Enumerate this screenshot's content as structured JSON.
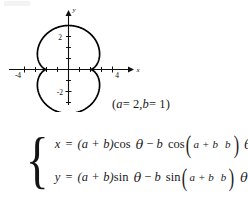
{
  "figure": {
    "caption_param": "(a = 2, b = 1)",
    "param_note": {
      "open": "(",
      "a_sym": "a",
      "a_eq": "= 2,",
      "b_sym": "b",
      "b_eq": "= 1)"
    },
    "smudge_name": "page-artifact"
  },
  "equations": {
    "brace": "{",
    "x": {
      "lhs": "x",
      "eq": "=",
      "amp": "(a + b)",
      "fn": "cos",
      "var": "θ",
      "minus": "−",
      "coef": "b",
      "fn2": "cos",
      "frac_num": "a + b",
      "frac_den": "b",
      "tail": "θ",
      "plain": "x = (a + b)cos θ − b cos((a + b)/b) θ"
    },
    "y": {
      "lhs": "y",
      "eq": "=",
      "amp": "(a + b)",
      "fn": "sin",
      "var": "θ",
      "minus": "−",
      "coef": "b",
      "fn2": "sin",
      "frac_num": "a + b",
      "frac_den": "b",
      "tail": "θ",
      "plain": "y = (a + b)sin θ − b sin((a + b)/b) θ"
    }
  },
  "chart_data": {
    "type": "line",
    "title": "",
    "xlabel": "x",
    "ylabel": "y",
    "xlim": [
      -5.2,
      5.2
    ],
    "ylim": [
      -3.9,
      3.9
    ],
    "grid": false,
    "legend": null,
    "x_ticks": [
      -4,
      -3,
      -2,
      -1,
      1,
      2,
      3,
      4
    ],
    "x_tick_labels": [
      "-4",
      "",
      "",
      "",
      "",
      "",
      "",
      "4"
    ],
    "y_ticks": [
      -3,
      -2,
      -1,
      1,
      2,
      3
    ],
    "y_tick_labels": [
      "",
      "-2",
      "",
      "",
      "2",
      ""
    ],
    "annotations": [
      "(a = 2, b = 1)"
    ],
    "series": [
      {
        "name": "epicycloid a=2 b=1 (nephroid)",
        "parametric": true,
        "theta_range": [
          0,
          6.283185307179586
        ],
        "x_expr": "(a + b)*cos(t) - b*cos(((a + b)/b)*t)",
        "y_expr": "(a + b)*sin(t) - b*sin(((a + b)/b)*t)",
        "a": 2,
        "b": 1,
        "points": [
          [
            2.0,
            0.0
          ],
          [
            1.866,
            0.741
          ],
          [
            1.5,
            1.366
          ],
          [
            1.0,
            1.732
          ],
          [
            0.5,
            1.866
          ],
          [
            0.0,
            1.866
          ],
          [
            -0.5,
            1.866
          ],
          [
            -1.0,
            1.732
          ],
          [
            -1.5,
            1.366
          ],
          [
            -1.866,
            0.741
          ],
          [
            -2.0,
            0.0
          ],
          [
            -1.866,
            -0.741
          ],
          [
            -1.5,
            -1.366
          ],
          [
            -1.0,
            -1.732
          ],
          [
            -0.5,
            -1.866
          ],
          [
            0.0,
            -1.866
          ],
          [
            0.5,
            -1.866
          ],
          [
            1.0,
            -1.732
          ],
          [
            1.5,
            -1.366
          ],
          [
            1.866,
            -0.741
          ],
          [
            2.0,
            0.0
          ]
        ]
      }
    ]
  }
}
